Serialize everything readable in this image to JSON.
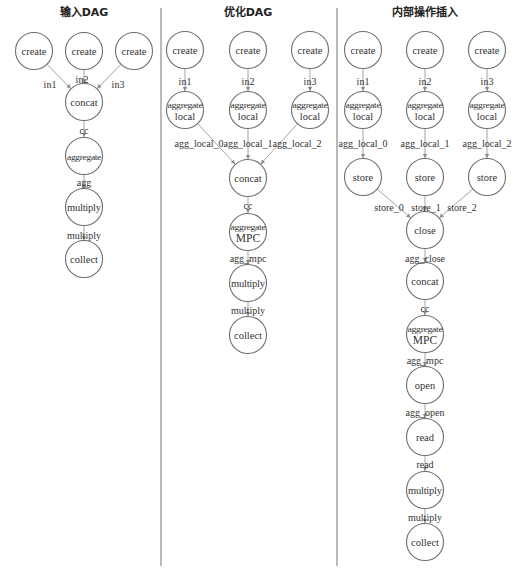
{
  "panels": [
    {
      "title": "输入DAG",
      "nodes": [
        {
          "id": "p1_create1",
          "label": [
            "create"
          ],
          "x": 34,
          "y": 51
        },
        {
          "id": "p1_create2",
          "label": [
            "create"
          ],
          "x": 84,
          "y": 51
        },
        {
          "id": "p1_create3",
          "label": [
            "create"
          ],
          "x": 134,
          "y": 51
        },
        {
          "id": "p1_concat",
          "label": [
            "concat"
          ],
          "x": 84,
          "y": 102
        },
        {
          "id": "p1_aggregate",
          "label": [
            "aggregate"
          ],
          "x": 84,
          "y": 156,
          "small": true
        },
        {
          "id": "p1_multiply",
          "label": [
            "multiply"
          ],
          "x": 84,
          "y": 207
        },
        {
          "id": "p1_collect",
          "label": [
            "collect"
          ],
          "x": 84,
          "y": 259
        }
      ],
      "edges": [
        {
          "from": "p1_create1",
          "to": "p1_concat",
          "label": "in1",
          "lx": 50,
          "ly": 84
        },
        {
          "from": "p1_create2",
          "to": "p1_concat",
          "label": "in2",
          "lx": 82,
          "ly": 79
        },
        {
          "from": "p1_create3",
          "to": "p1_concat",
          "label": "in3",
          "lx": 118,
          "ly": 84
        },
        {
          "from": "p1_concat",
          "to": "p1_aggregate",
          "label": "cc",
          "lx": 84,
          "ly": 130
        },
        {
          "from": "p1_aggregate",
          "to": "p1_multiply",
          "label": "agg",
          "lx": 84,
          "ly": 182
        },
        {
          "from": "p1_multiply",
          "to": "p1_collect",
          "label": "multiply",
          "lx": 84,
          "ly": 235
        }
      ]
    },
    {
      "title": "优化DAG",
      "nodes": [
        {
          "id": "p2_create1",
          "label": [
            "create"
          ],
          "x": 185,
          "y": 50
        },
        {
          "id": "p2_create2",
          "label": [
            "create"
          ],
          "x": 248,
          "y": 50
        },
        {
          "id": "p2_create3",
          "label": [
            "create"
          ],
          "x": 310,
          "y": 50
        },
        {
          "id": "p2_agglocal1",
          "label": [
            "aggregate",
            "local"
          ],
          "x": 185,
          "y": 110,
          "small": true
        },
        {
          "id": "p2_agglocal2",
          "label": [
            "aggregate",
            "local"
          ],
          "x": 248,
          "y": 110,
          "small": true
        },
        {
          "id": "p2_agglocal3",
          "label": [
            "aggregate",
            "local"
          ],
          "x": 310,
          "y": 110,
          "small": true
        },
        {
          "id": "p2_concat",
          "label": [
            "concat"
          ],
          "x": 248,
          "y": 178
        },
        {
          "id": "p2_aggmpc",
          "label": [
            "aggregate",
            "MPC"
          ],
          "x": 248,
          "y": 232,
          "mpc": true
        },
        {
          "id": "p2_multiply",
          "label": [
            "multiply"
          ],
          "x": 248,
          "y": 283
        },
        {
          "id": "p2_collect",
          "label": [
            "collect"
          ],
          "x": 248,
          "y": 335
        }
      ],
      "edges": [
        {
          "from": "p2_create1",
          "to": "p2_agglocal1",
          "label": "in1",
          "lx": 185,
          "ly": 81
        },
        {
          "from": "p2_create2",
          "to": "p2_agglocal2",
          "label": "in2",
          "lx": 248,
          "ly": 81
        },
        {
          "from": "p2_create3",
          "to": "p2_agglocal3",
          "label": "in3",
          "lx": 310,
          "ly": 81
        },
        {
          "from": "p2_agglocal1",
          "to": "p2_concat",
          "label": "agg_local_0",
          "lx": 199,
          "ly": 143
        },
        {
          "from": "p2_agglocal2",
          "to": "p2_concat",
          "label": "agg_local_1",
          "lx": 248,
          "ly": 143
        },
        {
          "from": "p2_agglocal3",
          "to": "p2_concat",
          "label": "agg_local_2",
          "lx": 297,
          "ly": 143
        },
        {
          "from": "p2_concat",
          "to": "p2_aggmpc",
          "label": "cc",
          "lx": 248,
          "ly": 205
        },
        {
          "from": "p2_aggmpc",
          "to": "p2_multiply",
          "label": "agg_mpc",
          "lx": 248,
          "ly": 258
        },
        {
          "from": "p2_multiply",
          "to": "p2_collect",
          "label": "multiply",
          "lx": 248,
          "ly": 310
        }
      ]
    },
    {
      "title": "内部操作插入",
      "nodes": [
        {
          "id": "p3_create1",
          "label": [
            "create"
          ],
          "x": 363,
          "y": 50
        },
        {
          "id": "p3_create2",
          "label": [
            "create"
          ],
          "x": 425,
          "y": 50
        },
        {
          "id": "p3_create3",
          "label": [
            "create"
          ],
          "x": 487,
          "y": 50
        },
        {
          "id": "p3_agglocal1",
          "label": [
            "aggregate",
            "local"
          ],
          "x": 363,
          "y": 110,
          "small": true
        },
        {
          "id": "p3_agglocal2",
          "label": [
            "aggregate",
            "local"
          ],
          "x": 425,
          "y": 110,
          "small": true
        },
        {
          "id": "p3_agglocal3",
          "label": [
            "aggregate",
            "local"
          ],
          "x": 487,
          "y": 110,
          "small": true
        },
        {
          "id": "p3_store1",
          "label": [
            "store"
          ],
          "x": 363,
          "y": 177
        },
        {
          "id": "p3_store2",
          "label": [
            "store"
          ],
          "x": 425,
          "y": 177
        },
        {
          "id": "p3_store3",
          "label": [
            "store"
          ],
          "x": 487,
          "y": 177
        },
        {
          "id": "p3_close",
          "label": [
            "close"
          ],
          "x": 425,
          "y": 230
        },
        {
          "id": "p3_concat",
          "label": [
            "concat"
          ],
          "x": 425,
          "y": 281
        },
        {
          "id": "p3_aggmpc",
          "label": [
            "aggregate",
            "MPC"
          ],
          "x": 425,
          "y": 334,
          "mpc": true
        },
        {
          "id": "p3_open",
          "label": [
            "open"
          ],
          "x": 425,
          "y": 385
        },
        {
          "id": "p3_read",
          "label": [
            "read"
          ],
          "x": 425,
          "y": 437
        },
        {
          "id": "p3_multiply",
          "label": [
            "multiply"
          ],
          "x": 425,
          "y": 490
        },
        {
          "id": "p3_collect",
          "label": [
            "collect"
          ],
          "x": 425,
          "y": 542
        }
      ],
      "edges": [
        {
          "from": "p3_create1",
          "to": "p3_agglocal1",
          "label": "in1",
          "lx": 363,
          "ly": 81
        },
        {
          "from": "p3_create2",
          "to": "p3_agglocal2",
          "label": "in2",
          "lx": 425,
          "ly": 81
        },
        {
          "from": "p3_create3",
          "to": "p3_agglocal3",
          "label": "in3",
          "lx": 487,
          "ly": 81
        },
        {
          "from": "p3_agglocal1",
          "to": "p3_store1",
          "label": "agg_local_0",
          "lx": 363,
          "ly": 143
        },
        {
          "from": "p3_agglocal2",
          "to": "p3_store2",
          "label": "agg_local_1",
          "lx": 425,
          "ly": 143
        },
        {
          "from": "p3_agglocal3",
          "to": "p3_store3",
          "label": "agg_local_2",
          "lx": 487,
          "ly": 143
        },
        {
          "from": "p3_store1",
          "to": "p3_close",
          "label": "store_0",
          "lx": 389,
          "ly": 207
        },
        {
          "from": "p3_store2",
          "to": "p3_close",
          "label": "store_1",
          "lx": 426,
          "ly": 207
        },
        {
          "from": "p3_store3",
          "to": "p3_close",
          "label": "store_2",
          "lx": 462,
          "ly": 207
        },
        {
          "from": "p3_close",
          "to": "p3_concat",
          "label": "agg_close",
          "lx": 425,
          "ly": 258
        },
        {
          "from": "p3_concat",
          "to": "p3_aggmpc",
          "label": "cc",
          "lx": 425,
          "ly": 308
        },
        {
          "from": "p3_aggmpc",
          "to": "p3_open",
          "label": "agg_mpc",
          "lx": 425,
          "ly": 360
        },
        {
          "from": "p3_open",
          "to": "p3_read",
          "label": "agg_open",
          "lx": 425,
          "ly": 412
        },
        {
          "from": "p3_read",
          "to": "p3_multiply",
          "label": "read",
          "lx": 425,
          "ly": 464
        },
        {
          "from": "p3_multiply",
          "to": "p3_collect",
          "label": "multiply",
          "lx": 425,
          "ly": 517
        }
      ]
    }
  ],
  "layout": {
    "title_y": 16,
    "title_x": [
      84,
      248,
      425
    ],
    "node_radius": 18.5,
    "dividers": [
      {
        "x": 161,
        "y1": 8,
        "y2": 566
      },
      {
        "x": 337,
        "y1": 8,
        "y2": 566
      }
    ],
    "colors": {
      "stroke": "#6e6e6e",
      "edge": "#9a9a9a",
      "divider": "#8c8c8c",
      "text": "#333333"
    }
  }
}
